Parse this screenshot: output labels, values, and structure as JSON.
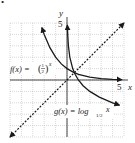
{
  "bullet": "•",
  "axes": {
    "x_label": "x",
    "y_label": "y",
    "x_tick_label": "5",
    "y_tick_label": "5"
  },
  "labels": {
    "f_prefix": "f(x) = ",
    "f_num": "1",
    "f_den": "2",
    "f_exp": "x",
    "g_prefix": "g(x) = log",
    "g_sub": "1/2",
    "g_arg": "x"
  },
  "colors": {
    "curve": "#1a1a1a",
    "grid": "#b0b0b0",
    "axis": "#1a1a1a"
  },
  "chart_data": {
    "type": "line",
    "title": "",
    "xlabel": "x",
    "ylabel": "y",
    "xlim": [
      -5,
      5
    ],
    "ylim": [
      -5,
      5
    ],
    "grid": true,
    "series": [
      {
        "name": "f(x) = (1/2)^x",
        "style": "solid",
        "x": [
          -2.2,
          -2,
          -1.5,
          -1,
          -0.5,
          0,
          0.5,
          1,
          2,
          3,
          4,
          4.8
        ],
        "y": [
          4.6,
          4,
          2.83,
          2,
          1.41,
          1,
          0.71,
          0.5,
          0.25,
          0.125,
          0.0625,
          0.036
        ]
      },
      {
        "name": "g(x) = log_{1/2} x",
        "style": "solid",
        "x": [
          0.036,
          0.0625,
          0.125,
          0.25,
          0.5,
          0.71,
          1,
          1.41,
          2,
          2.83,
          4,
          4.6
        ],
        "y": [
          4.8,
          4,
          3,
          2,
          1,
          0.5,
          0,
          -0.5,
          -1,
          -1.5,
          -2,
          -2.2
        ]
      },
      {
        "name": "y = x",
        "style": "dashed",
        "x": [
          -5,
          5
        ],
        "y": [
          -5,
          5
        ]
      }
    ],
    "annotations": [
      "f(x) = (1/2)^x",
      "g(x) = log_{1/2} x",
      "5",
      "5"
    ]
  }
}
